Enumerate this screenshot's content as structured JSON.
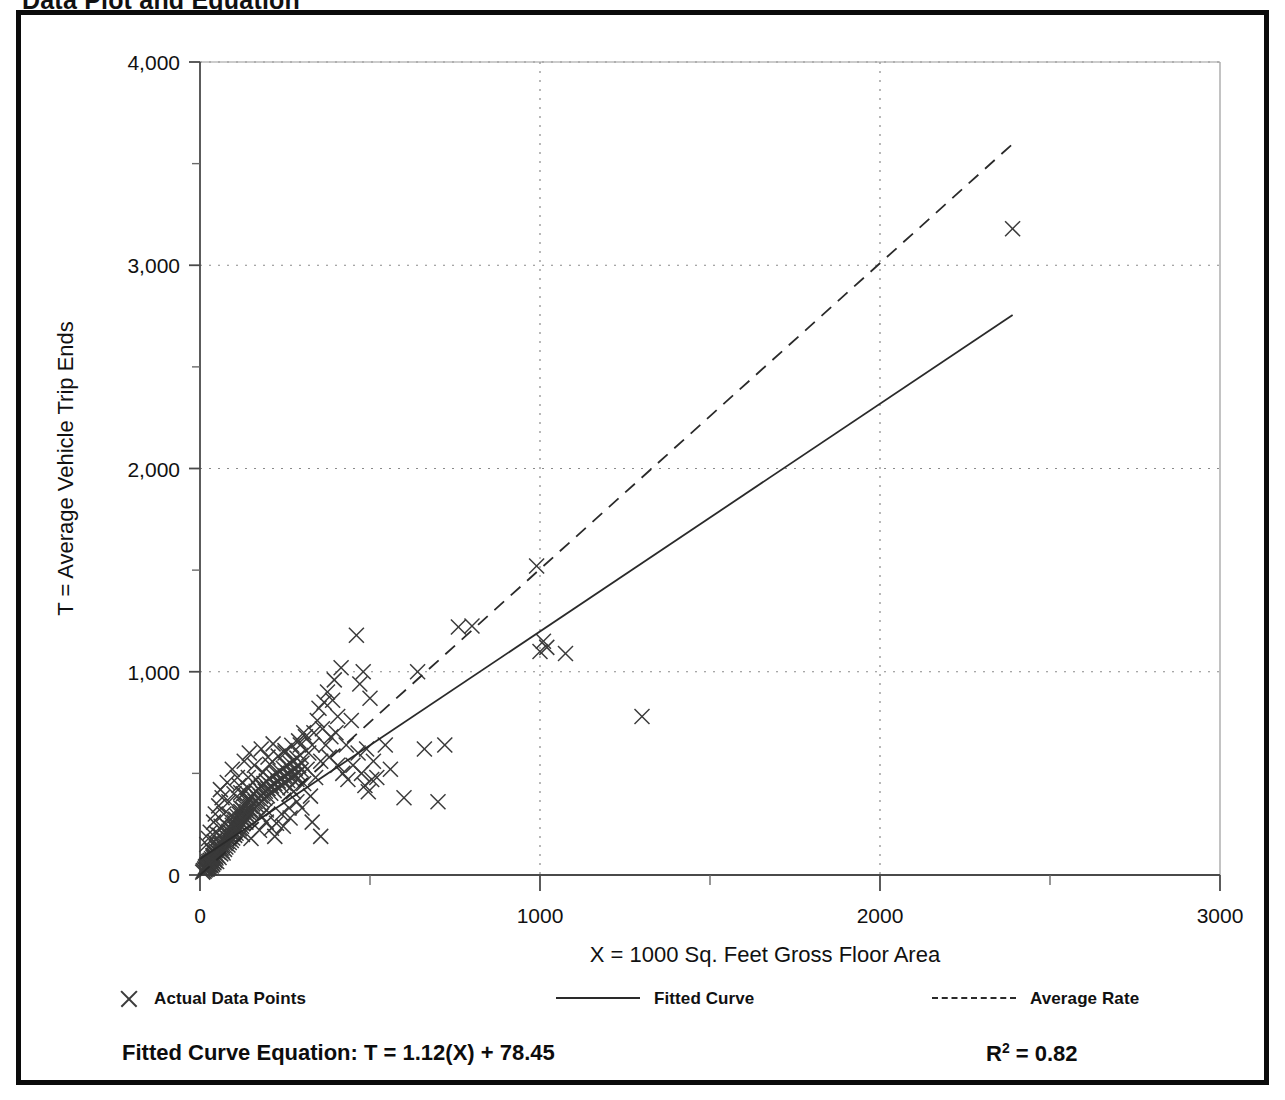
{
  "page": {
    "title": "Data Plot and Equation"
  },
  "legend": {
    "items": [
      {
        "glyph": "x-marker-icon",
        "label": "Actual Data Points"
      },
      {
        "glyph": "solid-line-icon",
        "label": "Fitted Curve"
      },
      {
        "glyph": "dashed-line-icon",
        "label": "Average Rate"
      }
    ]
  },
  "equation": {
    "fitted_label": "Fitted Curve Equation:  T = 1.12(X) + 78.45",
    "r_squared_prefix": "R",
    "r_squared_exp": "2",
    "r_squared_value": " = 0.82"
  },
  "chart_data": {
    "type": "scatter",
    "title": "Data Plot and Equation",
    "xlabel": "X = 1000 Sq. Feet Gross Floor Area",
    "ylabel": "T = Average Vehicle Trip Ends",
    "xlim": [
      0,
      3000
    ],
    "ylim": [
      0,
      4000
    ],
    "x_ticks": [
      0,
      1000,
      2000,
      3000
    ],
    "x_tick_labels": [
      "0",
      "1000",
      "2000",
      "3000"
    ],
    "x_minor_ticks": [
      500,
      1500,
      2500
    ],
    "y_ticks": [
      0,
      1000,
      2000,
      3000,
      4000
    ],
    "y_tick_labels": [
      "0",
      "1,000",
      "2,000",
      "3,000",
      "4,000"
    ],
    "y_minor_ticks": [
      500,
      1500,
      2500,
      3500
    ],
    "grid": "dotted-major",
    "legend_position": "below-plot",
    "series": [
      {
        "name": "Actual Data Points",
        "type": "scatter",
        "marker": "x",
        "color": "#3a3a3a",
        "points": [
          [
            8,
            14
          ],
          [
            10,
            22
          ],
          [
            12,
            18
          ],
          [
            14,
            30
          ],
          [
            15,
            25
          ],
          [
            16,
            40
          ],
          [
            18,
            28
          ],
          [
            19,
            45
          ],
          [
            20,
            35
          ],
          [
            21,
            52
          ],
          [
            22,
            30
          ],
          [
            23,
            60
          ],
          [
            24,
            42
          ],
          [
            25,
            38
          ],
          [
            26,
            66
          ],
          [
            27,
            48
          ],
          [
            28,
            55
          ],
          [
            29,
            35
          ],
          [
            30,
            72
          ],
          [
            31,
            50
          ],
          [
            32,
            62
          ],
          [
            33,
            44
          ],
          [
            34,
            80
          ],
          [
            35,
            58
          ],
          [
            36,
            70
          ],
          [
            37,
            52
          ],
          [
            38,
            88
          ],
          [
            39,
            64
          ],
          [
            40,
            96
          ],
          [
            41,
            60
          ],
          [
            42,
            78
          ],
          [
            43,
            110
          ],
          [
            44,
            70
          ],
          [
            45,
            92
          ],
          [
            46,
            120
          ],
          [
            47,
            84
          ],
          [
            48,
            102
          ],
          [
            49,
            66
          ],
          [
            50,
            130
          ],
          [
            52,
            95
          ],
          [
            54,
            112
          ],
          [
            55,
            140
          ],
          [
            56,
            86
          ],
          [
            58,
            124
          ],
          [
            60,
            150
          ],
          [
            61,
            104
          ],
          [
            62,
            132
          ],
          [
            64,
            160
          ],
          [
            65,
            118
          ],
          [
            66,
            145
          ],
          [
            68,
            108
          ],
          [
            70,
            172
          ],
          [
            72,
            126
          ],
          [
            74,
            155
          ],
          [
            75,
            190
          ],
          [
            76,
            138
          ],
          [
            78,
            165
          ],
          [
            80,
            200
          ],
          [
            82,
            148
          ],
          [
            84,
            178
          ],
          [
            85,
            215
          ],
          [
            86,
            160
          ],
          [
            88,
            188
          ],
          [
            90,
            230
          ],
          [
            92,
            170
          ],
          [
            94,
            202
          ],
          [
            95,
            245
          ],
          [
            96,
            182
          ],
          [
            98,
            212
          ],
          [
            100,
            260
          ],
          [
            102,
            195
          ],
          [
            104,
            225
          ],
          [
            105,
            275
          ],
          [
            106,
            205
          ],
          [
            108,
            238
          ],
          [
            110,
            288
          ],
          [
            112,
            218
          ],
          [
            114,
            250
          ],
          [
            115,
            300
          ],
          [
            116,
            228
          ],
          [
            118,
            262
          ],
          [
            120,
            312
          ],
          [
            122,
            240
          ],
          [
            124,
            275
          ],
          [
            125,
            325
          ],
          [
            126,
            252
          ],
          [
            128,
            288
          ],
          [
            130,
            338
          ],
          [
            132,
            265
          ],
          [
            134,
            300
          ],
          [
            135,
            350
          ],
          [
            136,
            278
          ],
          [
            138,
            312
          ],
          [
            140,
            362
          ],
          [
            142,
            290
          ],
          [
            144,
            325
          ],
          [
            145,
            375
          ],
          [
            146,
            302
          ],
          [
            148,
            338
          ],
          [
            150,
            388
          ],
          [
            152,
            315
          ],
          [
            155,
            350
          ],
          [
            158,
            400
          ],
          [
            160,
            328
          ],
          [
            162,
            362
          ],
          [
            165,
            412
          ],
          [
            168,
            340
          ],
          [
            170,
            375
          ],
          [
            172,
            425
          ],
          [
            175,
            352
          ],
          [
            178,
            388
          ],
          [
            180,
            438
          ],
          [
            182,
            365
          ],
          [
            185,
            400
          ],
          [
            188,
            450
          ],
          [
            190,
            378
          ],
          [
            192,
            412
          ],
          [
            195,
            462
          ],
          [
            198,
            390
          ],
          [
            200,
            425
          ],
          [
            205,
            475
          ],
          [
            208,
            402
          ],
          [
            210,
            438
          ],
          [
            215,
            488
          ],
          [
            218,
            415
          ],
          [
            220,
            450
          ],
          [
            225,
            500
          ],
          [
            228,
            428
          ],
          [
            230,
            462
          ],
          [
            235,
            512
          ],
          [
            238,
            440
          ],
          [
            240,
            475
          ],
          [
            245,
            525
          ],
          [
            248,
            452
          ],
          [
            250,
            488
          ],
          [
            255,
            538
          ],
          [
            258,
            465
          ],
          [
            260,
            500
          ],
          [
            265,
            550
          ],
          [
            268,
            478
          ],
          [
            270,
            512
          ],
          [
            275,
            562
          ],
          [
            278,
            490
          ],
          [
            280,
            525
          ],
          [
            285,
            575
          ],
          [
            288,
            502
          ],
          [
            290,
            538
          ],
          [
            295,
            588
          ],
          [
            298,
            515
          ],
          [
            300,
            550
          ],
          [
            60,
            420
          ],
          [
            80,
            455
          ],
          [
            95,
            520
          ],
          [
            110,
            480
          ],
          [
            130,
            560
          ],
          [
            145,
            600
          ],
          [
            160,
            540
          ],
          [
            180,
            620
          ],
          [
            200,
            580
          ],
          [
            215,
            645
          ],
          [
            120,
            405
          ],
          [
            140,
            430
          ],
          [
            165,
            470
          ],
          [
            185,
            505
          ],
          [
            205,
            545
          ],
          [
            230,
            585
          ],
          [
            250,
            612
          ],
          [
            270,
            638
          ],
          [
            290,
            660
          ],
          [
            310,
            680
          ],
          [
            75,
            250
          ],
          [
            90,
            290
          ],
          [
            105,
            230
          ],
          [
            125,
            200
          ],
          [
            150,
            180
          ],
          [
            175,
            220
          ],
          [
            195,
            260
          ],
          [
            220,
            190
          ],
          [
            245,
            240
          ],
          [
            265,
            280
          ],
          [
            305,
            450
          ],
          [
            315,
            520
          ],
          [
            320,
            600
          ],
          [
            325,
            388
          ],
          [
            330,
            640
          ],
          [
            335,
            700
          ],
          [
            340,
            480
          ],
          [
            345,
            760
          ],
          [
            350,
            820
          ],
          [
            355,
            560
          ],
          [
            360,
            720
          ],
          [
            365,
            850
          ],
          [
            370,
            640
          ],
          [
            375,
            900
          ],
          [
            380,
            580
          ],
          [
            385,
            680
          ],
          [
            390,
            860
          ],
          [
            395,
            960
          ],
          [
            400,
            700
          ],
          [
            405,
            780
          ],
          [
            330,
            260
          ],
          [
            355,
            190
          ],
          [
            300,
            330
          ],
          [
            285,
            360
          ],
          [
            262,
            330
          ],
          [
            240,
            300
          ],
          [
            225,
            255
          ],
          [
            210,
            230
          ],
          [
            195,
            320
          ],
          [
            180,
            290
          ],
          [
            415,
            1020
          ],
          [
            430,
            640
          ],
          [
            445,
            760
          ],
          [
            460,
            1180
          ],
          [
            470,
            940
          ],
          [
            480,
            1000
          ],
          [
            490,
            620
          ],
          [
            500,
            870
          ],
          [
            510,
            560
          ],
          [
            520,
            480
          ],
          [
            545,
            640
          ],
          [
            560,
            520
          ],
          [
            600,
            380
          ],
          [
            640,
            1000
          ],
          [
            660,
            620
          ],
          [
            700,
            360
          ],
          [
            720,
            640
          ],
          [
            760,
            1220
          ],
          [
            800,
            1225
          ],
          [
            990,
            1520
          ],
          [
            1000,
            1100
          ],
          [
            1010,
            1150
          ],
          [
            1020,
            1120
          ],
          [
            1075,
            1090
          ],
          [
            1300,
            780
          ],
          [
            2390,
            3180
          ],
          [
            250,
            600
          ],
          [
            265,
            430
          ],
          [
            275,
            410
          ],
          [
            285,
            470
          ],
          [
            295,
            640
          ],
          [
            305,
            700
          ],
          [
            120,
            330
          ],
          [
            135,
            260
          ],
          [
            150,
            310
          ],
          [
            40,
            260
          ],
          [
            45,
            300
          ],
          [
            55,
            340
          ],
          [
            65,
            380
          ],
          [
            70,
            300
          ],
          [
            85,
            360
          ],
          [
            100,
            400
          ],
          [
            115,
            440
          ],
          [
            128,
            400
          ],
          [
            142,
            480
          ],
          [
            20,
            150
          ],
          [
            25,
            180
          ],
          [
            30,
            210
          ],
          [
            35,
            120
          ],
          [
            38,
            95
          ],
          [
            42,
            165
          ],
          [
            48,
            205
          ],
          [
            52,
            145
          ],
          [
            58,
            195
          ],
          [
            62,
            240
          ],
          [
            405,
            540
          ],
          [
            420,
            500
          ],
          [
            435,
            470
          ],
          [
            450,
            540
          ],
          [
            465,
            600
          ],
          [
            475,
            500
          ],
          [
            485,
            440
          ],
          [
            495,
            410
          ],
          [
            505,
            470
          ]
        ]
      },
      {
        "name": "Fitted Curve",
        "type": "line",
        "style": "solid",
        "color": "#2a2a2a",
        "equation": "T = 1.12(X) + 78.45",
        "slope": 1.12,
        "intercept": 78.45,
        "r_squared": 0.82,
        "x_range": [
          0,
          2390
        ]
      },
      {
        "name": "Average Rate",
        "type": "line",
        "style": "dashed",
        "color": "#2a2a2a",
        "slope": 1.505,
        "intercept": 0,
        "x_range": [
          0,
          2390
        ]
      }
    ]
  }
}
